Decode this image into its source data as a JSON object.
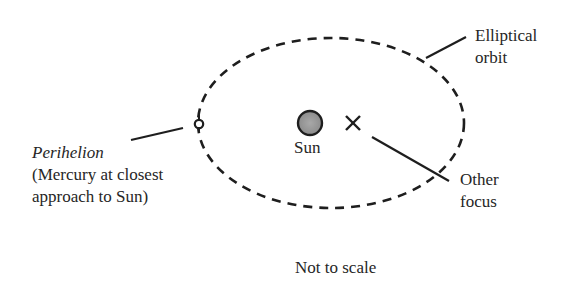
{
  "diagram": {
    "labels": {
      "orbit_line1": "Elliptical",
      "orbit_line2": "orbit",
      "perihelion_title": "Perihelion",
      "perihelion_line2": "(Mercury at closest",
      "perihelion_line3": "approach to Sun)",
      "sun": "Sun",
      "focus_line1": "Other",
      "focus_line2": "focus",
      "note": "Not to scale"
    },
    "elements": {
      "orbit": {
        "cx": 331,
        "cy": 123,
        "rx": 133,
        "ry": 85,
        "style": "dashed"
      },
      "sun": {
        "cx": 310,
        "cy": 123,
        "r": 12,
        "fill": "#9a9a9a"
      },
      "perihelion_point": {
        "cx": 199,
        "cy": 124,
        "r": 4
      },
      "other_focus": {
        "cx": 353,
        "cy": 123,
        "marker": "x"
      }
    },
    "colors": {
      "stroke": "#1e1e1e",
      "text": "#262626",
      "sun_fill": "#9a9a9a"
    }
  }
}
